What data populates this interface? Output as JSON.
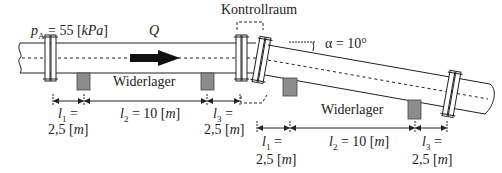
{
  "diagram": {
    "pressure_label": {
      "symbol": "p",
      "subscript": "A",
      "text": " = 55 [",
      "unit": "kPa",
      "close": "]"
    },
    "flow_label": "Q",
    "control_volume_label": "Kontrollraum",
    "angle_label": "α = 10°",
    "support_label_left": "Widerlager",
    "support_label_right": "Widerlager",
    "left_dimensions": [
      {
        "symbol": "l",
        "sub": "1",
        "eq": " =",
        "value": "2,5 [",
        "unit": "m",
        "close": "]"
      },
      {
        "symbol": "l",
        "sub": "2",
        "eq": " = 10 [",
        "unit": "m",
        "close": "]"
      },
      {
        "symbol": "l",
        "sub": "3",
        "eq": " =",
        "value": "2,5 [",
        "unit": "m",
        "close": "]"
      }
    ],
    "right_dimensions": [
      {
        "symbol": "l",
        "sub": "1",
        "eq": " =",
        "value": "2,5 [",
        "unit": "m",
        "close": "]"
      },
      {
        "symbol": "l",
        "sub": "2",
        "eq": " = 10 [",
        "unit": "m",
        "close": "]"
      },
      {
        "symbol": "l",
        "sub": "3",
        "eq": " =",
        "value": "2,5 [",
        "unit": "m",
        "close": "]"
      }
    ],
    "colors": {
      "line": "#222222",
      "support_fill": "#8c8c8c",
      "arrow": "#111111"
    }
  }
}
